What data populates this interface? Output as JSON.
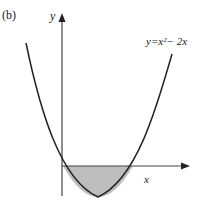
{
  "figure": {
    "panel_label": "(b)",
    "y_axis_label": "y",
    "x_axis_label": "x",
    "curve_label": "y=x²− 2x",
    "equation": "y = x^2 - 2x",
    "shaded_region": "area between curve and x-axis for 0 ≤ x ≤ 2",
    "colors": {
      "curve": "#222222",
      "axes": "#333333",
      "shade": "#bdbdbd"
    }
  }
}
